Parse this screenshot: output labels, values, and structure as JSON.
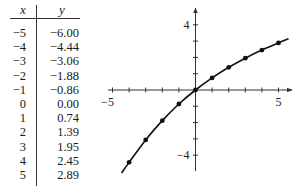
{
  "table": {
    "headers": [
      "x",
      "y"
    ],
    "rows": [
      {
        "x": "−5",
        "y": "−6.00"
      },
      {
        "x": "−4",
        "y": "−4.44"
      },
      {
        "x": "−3",
        "y": "−3.06"
      },
      {
        "x": "−2",
        "y": "−1.88"
      },
      {
        "x": "−1",
        "y": "−0.86"
      },
      {
        "x": "0",
        "y": "0.00"
      },
      {
        "x": "1",
        "y": "0.74"
      },
      {
        "x": "2",
        "y": "1.39"
      },
      {
        "x": "3",
        "y": "1.95"
      },
      {
        "x": "4",
        "y": "2.45"
      },
      {
        "x": "5",
        "y": "2.89"
      }
    ]
  },
  "chart_data": {
    "type": "line",
    "title": "",
    "xlabel": "",
    "ylabel": "",
    "x": [
      -4,
      -3,
      -2,
      -1,
      0,
      1,
      2,
      3,
      4,
      5
    ],
    "series": [
      {
        "name": "y",
        "values": [
          -4.44,
          -3.06,
          -1.88,
          -0.86,
          0.0,
          0.74,
          1.39,
          1.95,
          2.45,
          2.89
        ]
      }
    ],
    "curve_range_x": [
      -4.45,
      5.6
    ],
    "xlim": [
      -5,
      5.6
    ],
    "ylim": [
      -5,
      5
    ],
    "x_ticks": [
      -5,
      -4,
      -3,
      -2,
      -1,
      1,
      2,
      3,
      4,
      5
    ],
    "y_ticks": [
      -4,
      -3,
      -2,
      -1,
      1,
      2,
      3,
      4
    ],
    "x_tick_labels": [
      {
        "value": -5,
        "label": "−5"
      },
      {
        "value": 5,
        "label": "5"
      }
    ],
    "y_tick_labels": [
      {
        "value": 4,
        "label": "4"
      },
      {
        "value": -4,
        "label": "−4"
      }
    ],
    "grid": false,
    "markers": true,
    "colors": {
      "curve": "#111111",
      "axis": "#333333"
    }
  }
}
